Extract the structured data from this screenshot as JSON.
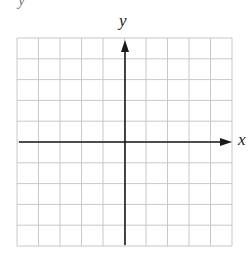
{
  "diagram": {
    "type": "coordinate-plane",
    "grid": {
      "columns": 10,
      "rows": 10,
      "left": 17,
      "top": 38,
      "width": 215,
      "height": 208,
      "line_color": "#c8c8c8"
    },
    "axes": {
      "color": "#1a1a1a",
      "x_axis": {
        "label": "x",
        "y": 142,
        "x_start": 19,
        "x_end": 232,
        "arrow": "right"
      },
      "y_axis": {
        "label": "y",
        "x": 125,
        "y_start": 245,
        "y_end": 40,
        "arrow": "up"
      }
    },
    "cutoff_text": "y"
  }
}
